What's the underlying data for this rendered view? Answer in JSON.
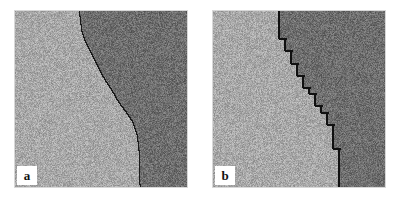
{
  "figure": {
    "name": "two-panel-interface-comparison",
    "background_color": "#ffffff",
    "panel_count": 2
  },
  "panels": [
    {
      "id": "a",
      "label": "a",
      "label_position": "bottom-left",
      "interface_style": "smooth-continuous",
      "left_region": {
        "name": "light-phase",
        "color": "#a8a8a8",
        "noise": "speckle"
      },
      "right_region": {
        "name": "dark-phase",
        "color": "#6e6e6e",
        "noise": "speckle"
      },
      "interface_color": "#1a1a1a",
      "interface_width_px": 1,
      "interface_points": [
        [
          0.37,
          0.0
        ],
        [
          0.375,
          0.03
        ],
        [
          0.38,
          0.07
        ],
        [
          0.385,
          0.11
        ],
        [
          0.4,
          0.16
        ],
        [
          0.43,
          0.22
        ],
        [
          0.46,
          0.28
        ],
        [
          0.49,
          0.34
        ],
        [
          0.525,
          0.4
        ],
        [
          0.565,
          0.46
        ],
        [
          0.6,
          0.52
        ],
        [
          0.645,
          0.58
        ],
        [
          0.685,
          0.64
        ],
        [
          0.705,
          0.7
        ],
        [
          0.715,
          0.76
        ],
        [
          0.72,
          0.82
        ],
        [
          0.722,
          0.88
        ],
        [
          0.723,
          0.94
        ],
        [
          0.724,
          1.0
        ]
      ]
    },
    {
      "id": "b",
      "label": "b",
      "label_position": "bottom-left",
      "interface_style": "lattice-discretized-staircase",
      "left_region": {
        "name": "light-phase",
        "color": "#a8a8a8",
        "noise": "speckle"
      },
      "right_region": {
        "name": "dark-phase",
        "color": "#6e6e6e",
        "noise": "speckle"
      },
      "interface_color": "#111111",
      "interface_width_px": 2,
      "step_size": 0.035,
      "interface_points": [
        [
          0.37,
          0.0
        ],
        [
          0.375,
          0.03
        ],
        [
          0.38,
          0.07
        ],
        [
          0.385,
          0.11
        ],
        [
          0.4,
          0.16
        ],
        [
          0.43,
          0.22
        ],
        [
          0.46,
          0.28
        ],
        [
          0.49,
          0.34
        ],
        [
          0.525,
          0.4
        ],
        [
          0.565,
          0.46
        ],
        [
          0.6,
          0.52
        ],
        [
          0.645,
          0.58
        ],
        [
          0.685,
          0.64
        ],
        [
          0.705,
          0.7
        ],
        [
          0.715,
          0.76
        ],
        [
          0.72,
          0.82
        ],
        [
          0.722,
          0.88
        ],
        [
          0.723,
          0.94
        ],
        [
          0.724,
          1.0
        ]
      ]
    }
  ],
  "colors": {
    "light_phase": "#a8a8a8",
    "dark_phase": "#6e6e6e",
    "interface": "#1a1a1a",
    "label_box": "#ffffff",
    "label_text": "#111111",
    "page_background": "#ffffff"
  }
}
